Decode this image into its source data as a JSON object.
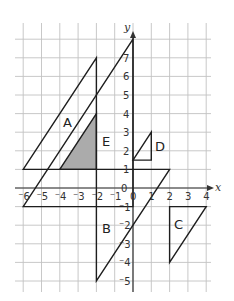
{
  "diagram": {
    "type": "coordinate-grid-transformations",
    "axes": {
      "x_label": "x",
      "y_label": "y",
      "x_range": [
        -6,
        4
      ],
      "y_range": [
        -5,
        8
      ],
      "x_ticks": [
        "-6",
        "-5",
        "-4",
        "-3",
        "-2",
        "-1",
        "0",
        "1",
        "2",
        "3",
        "4"
      ],
      "y_ticks": [
        "-5",
        "-4",
        "-3",
        "-2",
        "-1",
        "0",
        "1",
        "2",
        "3",
        "4",
        "5",
        "6",
        "7"
      ]
    },
    "shapes": [
      {
        "label": "A",
        "vertices": [
          [
            -6,
            1
          ],
          [
            -2,
            7
          ],
          [
            -2,
            1
          ]
        ],
        "filled": false
      },
      {
        "label": "E",
        "vertices": [
          [
            -6,
            -1
          ],
          [
            0,
            8
          ],
          [
            0,
            -1
          ]
        ],
        "filled": false
      },
      {
        "label": "B",
        "vertices": [
          [
            -2,
            -5
          ],
          [
            -2,
            1
          ],
          [
            2,
            1
          ]
        ],
        "filled": false
      },
      {
        "label": "C",
        "vertices": [
          [
            2,
            -1
          ],
          [
            4,
            -1
          ],
          [
            2,
            -4
          ]
        ],
        "filled": false
      },
      {
        "label": "D",
        "vertices": [
          [
            0,
            1.5
          ],
          [
            1,
            3
          ],
          [
            1,
            1.5
          ]
        ],
        "filled": false
      },
      {
        "label": "",
        "name": "object",
        "vertices": [
          [
            -4,
            1
          ],
          [
            -2,
            1
          ],
          [
            -2,
            4
          ]
        ],
        "filled": true
      }
    ],
    "labels": {
      "A": "A",
      "B": "B",
      "C": "C",
      "D": "D",
      "E": "E"
    },
    "colors": {
      "grid": "#c2c2c2",
      "lines": "#1e1e1e",
      "shaded": "#ababab"
    }
  }
}
